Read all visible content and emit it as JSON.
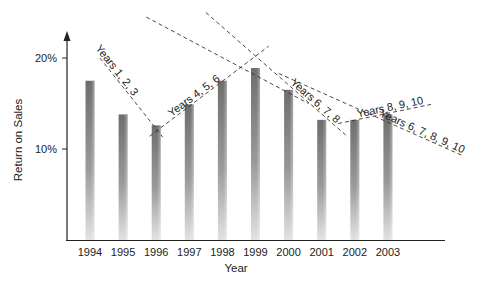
{
  "chart_data": {
    "type": "bar",
    "title": "",
    "xlabel": "Year",
    "ylabel": "Return on Sales",
    "categories": [
      "1994",
      "1995",
      "1996",
      "1997",
      "1998",
      "1999",
      "2000",
      "2001",
      "2002",
      "2003"
    ],
    "values": [
      17.5,
      13.8,
      12.6,
      14.9,
      17.5,
      18.9,
      16.5,
      13.2,
      13.2,
      13.8
    ],
    "value_unit": "%",
    "ylim": [
      0,
      21
    ],
    "yticks": [
      {
        "value": 10,
        "label": "10%"
      },
      {
        "value": 20,
        "label": "20%"
      }
    ],
    "grid": false,
    "legend": "none",
    "bar_color": "#7a7a7a",
    "trendlines": [
      {
        "label": "Years 1, 2, 3",
        "from": {
          "x": 0.3,
          "y": 20.0
        },
        "to": {
          "x": 2.2,
          "y": 11.3
        },
        "label_anchor_x": 0.1
      },
      {
        "label": "Years 4, 5, 6",
        "from": {
          "x": 1.8,
          "y": 11.4
        },
        "to": {
          "x": 5.4,
          "y": 21.3
        },
        "label_anchor_x": 2.5
      },
      {
        "label": "",
        "from": {
          "x": 1.7,
          "y": 24.5
        },
        "to": {
          "x": 6.6,
          "y": 15.0
        },
        "label_anchor_x": null
      },
      {
        "label": "Years 6, 7, 8",
        "from": {
          "x": 3.5,
          "y": 25.0
        },
        "to": {
          "x": 7.8,
          "y": 11.3
        },
        "label_anchor_x": 6.0
      },
      {
        "label": "Years 8, 9, 10",
        "from": {
          "x": 7.5,
          "y": 12.8
        },
        "to": {
          "x": 10.3,
          "y": 14.9
        },
        "label_anchor_x": 8.1
      },
      {
        "label": "Years 6, 7, 8, 9, 10",
        "from": {
          "x": 5.7,
          "y": 18.3
        },
        "to": {
          "x": 11.3,
          "y": 9.2
        },
        "label_anchor_x": 8.7
      }
    ]
  }
}
